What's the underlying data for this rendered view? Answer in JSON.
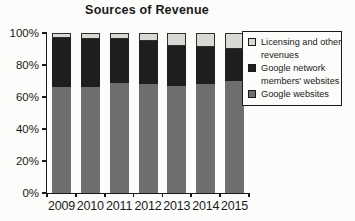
{
  "chart_data": {
    "type": "bar",
    "stacked": true,
    "title": "Sources of Revenue",
    "xlabel": "",
    "ylabel": "",
    "ylim": [
      0,
      100
    ],
    "grid": false,
    "categories": [
      "2009",
      "2010",
      "2011",
      "2012",
      "2013",
      "2014",
      "2015"
    ],
    "series": [
      {
        "name": "Google websites",
        "color": "#6e6e6e",
        "values": [
          66,
          66,
          69,
          68,
          67,
          68,
          70
        ]
      },
      {
        "name": "Google network members' websites",
        "color": "#1e1e1e",
        "values": [
          31,
          30,
          27,
          27,
          25,
          23,
          20
        ]
      },
      {
        "name": "Licensing and other revenues",
        "color": "#d8d8d5",
        "values": [
          3,
          4,
          4,
          5,
          8,
          9,
          10
        ]
      }
    ],
    "y_ticks": [
      {
        "label": "0%",
        "value": 0
      },
      {
        "label": "20%",
        "value": 20
      },
      {
        "label": "40%",
        "value": 40
      },
      {
        "label": "60%",
        "value": 60
      },
      {
        "label": "80%",
        "value": 80
      },
      {
        "label": "100%",
        "value": 100
      }
    ],
    "legend": {
      "position": "top-right",
      "entries": [
        {
          "label_lines": [
            "Licensing and other",
            "revenues"
          ],
          "color": "#d8d8d5"
        },
        {
          "label_lines": [
            "Google network",
            "members' websites"
          ],
          "color": "#1e1e1e"
        },
        {
          "label_lines": [
            "Google websites"
          ],
          "color": "#6e6e6e"
        }
      ]
    }
  }
}
